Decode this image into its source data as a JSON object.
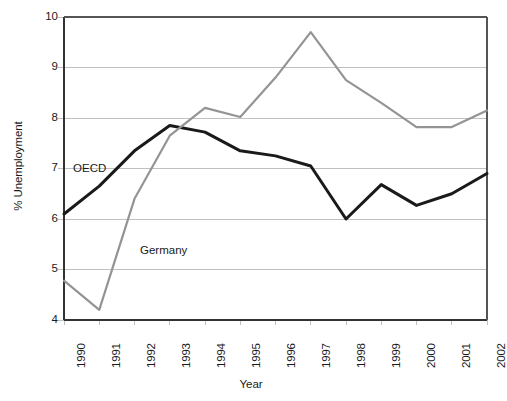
{
  "chart_data": {
    "type": "line",
    "title": "",
    "xlabel": "Year",
    "ylabel": "% Unemployment",
    "categories": [
      "1990",
      "1991",
      "1992",
      "1993",
      "1994",
      "1995",
      "1996",
      "1997",
      "1998",
      "1999",
      "2000",
      "2001",
      "2002"
    ],
    "xlim": [
      1990,
      2002
    ],
    "ylim": [
      4,
      10
    ],
    "yticks": [
      4,
      5,
      6,
      7,
      8,
      9,
      10
    ],
    "grid": "horizontal",
    "legend_position": "inline-labels",
    "series": [
      {
        "name": "OECD",
        "color": "#1a1a1a",
        "values": [
          6.1,
          6.65,
          7.35,
          7.85,
          7.72,
          7.35,
          7.25,
          7.05,
          6.0,
          6.68,
          6.27,
          6.5,
          6.9
        ]
      },
      {
        "name": "Germany",
        "color": "#949494",
        "values": [
          4.78,
          4.2,
          6.4,
          7.65,
          8.2,
          8.02,
          8.8,
          9.7,
          8.75,
          8.3,
          7.82,
          7.82,
          8.15
        ]
      }
    ],
    "annotations": [
      {
        "text": "OECD",
        "x": 1990.2,
        "y": 7.0
      },
      {
        "text": "Germany",
        "x": 1992.1,
        "y": 5.37
      }
    ]
  },
  "axis": {
    "ytick_labels": [
      "10",
      "9",
      "8",
      "7",
      "6",
      "5",
      "4"
    ],
    "xtick_labels": [
      "1990",
      "1991",
      "1992",
      "1993",
      "1994",
      "1995",
      "1996",
      "1997",
      "1998",
      "1999",
      "2000",
      "2001",
      "2002"
    ],
    "y_title": "% Unemployment",
    "x_title": "Year"
  },
  "footer": {
    "partial_text": ""
  },
  "colors": {
    "oecd": "#1a1a1a",
    "germany": "#949494",
    "grid": "#c0c0c0",
    "axis": "#333333",
    "background": "#ffffff"
  }
}
